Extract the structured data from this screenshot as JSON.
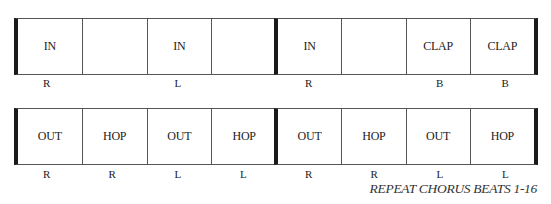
{
  "rows": [
    {
      "cells": [
        "IN",
        "",
        "IN",
        "",
        "IN",
        "",
        "CLAP",
        "CLAP"
      ],
      "labels": [
        "R",
        "",
        "L",
        "",
        "R",
        "",
        "B",
        "B"
      ]
    },
    {
      "cells": [
        "OUT",
        "HOP",
        "OUT",
        "HOP",
        "OUT",
        "HOP",
        "OUT",
        "HOP"
      ],
      "labels": [
        "R",
        "R",
        "L",
        "L",
        "R",
        "R",
        "L",
        "L"
      ]
    }
  ],
  "footer": "REPEAT CHORUS BEATS 1-16"
}
